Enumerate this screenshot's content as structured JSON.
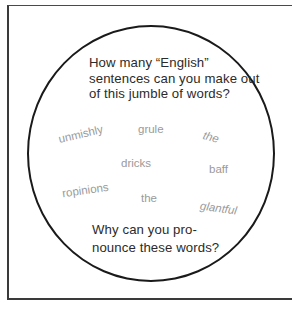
{
  "top_question": {
    "lines": [
      "How many “English”",
      "sentences can you make out",
      "of this jumble of words?"
    ]
  },
  "jumble_words": [
    "unmishly",
    "grule",
    "the",
    "dricks",
    "baff",
    "ropinions",
    "the",
    "glantful"
  ],
  "bottom_question": {
    "lines": [
      "Why can you pro-",
      "nounce these words?"
    ]
  }
}
